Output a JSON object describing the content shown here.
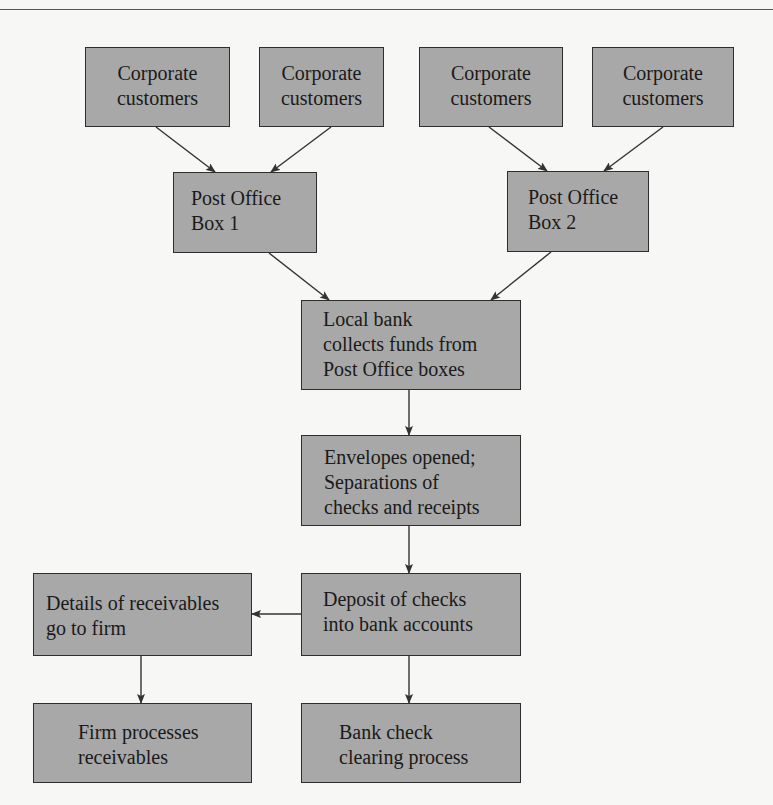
{
  "diagram": {
    "nodes": {
      "corporate_customers_1": {
        "lines": [
          "Corporate",
          "customers"
        ]
      },
      "corporate_customers_2": {
        "lines": [
          "Corporate",
          "customers"
        ]
      },
      "corporate_customers_3": {
        "lines": [
          "Corporate",
          "customers"
        ]
      },
      "corporate_customers_4": {
        "lines": [
          "Corporate",
          "customers"
        ]
      },
      "post_office_box_1": {
        "lines": [
          "Post Office",
          "Box 1"
        ]
      },
      "post_office_box_2": {
        "lines": [
          "Post Office",
          "Box 2"
        ]
      },
      "local_bank": {
        "lines": [
          "Local bank",
          "collects funds from",
          "Post Office boxes"
        ]
      },
      "envelopes_opened": {
        "lines": [
          "Envelopes opened;",
          "Separations of",
          "checks and receipts"
        ]
      },
      "deposit_checks": {
        "lines": [
          "Deposit of checks",
          "into bank accounts"
        ]
      },
      "details_receivables": {
        "lines": [
          "Details of receivables",
          "go to firm"
        ]
      },
      "firm_processes": {
        "lines": [
          "Firm processes",
          "receivables"
        ]
      },
      "bank_check_clearing": {
        "lines": [
          "Bank check",
          "clearing process"
        ]
      }
    },
    "edges": [
      {
        "from": "corporate_customers_1",
        "to": "post_office_box_1"
      },
      {
        "from": "corporate_customers_2",
        "to": "post_office_box_1"
      },
      {
        "from": "corporate_customers_3",
        "to": "post_office_box_2"
      },
      {
        "from": "corporate_customers_4",
        "to": "post_office_box_2"
      },
      {
        "from": "post_office_box_1",
        "to": "local_bank"
      },
      {
        "from": "post_office_box_2",
        "to": "local_bank"
      },
      {
        "from": "local_bank",
        "to": "envelopes_opened"
      },
      {
        "from": "envelopes_opened",
        "to": "deposit_checks"
      },
      {
        "from": "deposit_checks",
        "to": "details_receivables"
      },
      {
        "from": "deposit_checks",
        "to": "bank_check_clearing"
      },
      {
        "from": "details_receivables",
        "to": "firm_processes"
      }
    ],
    "colors": {
      "box_fill": "#a8a8a8",
      "box_border": "#2e2e2e",
      "arrow": "#333333",
      "background": "#f7f7f5"
    }
  }
}
